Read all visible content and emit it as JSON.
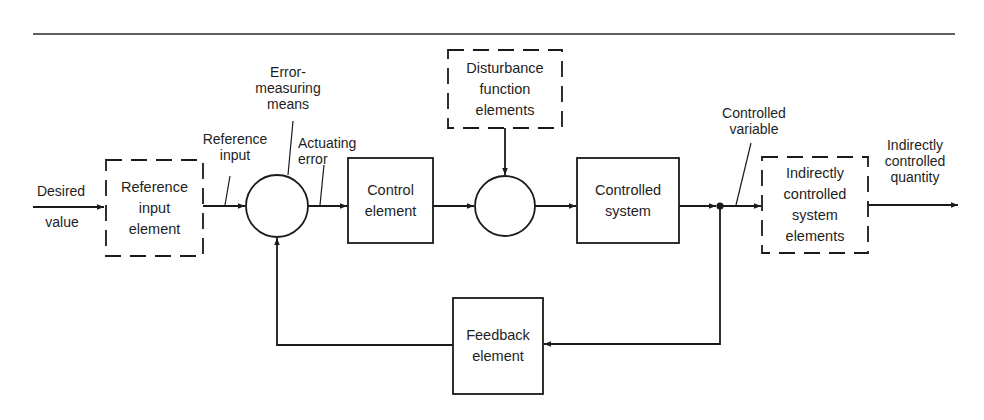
{
  "diagram": {
    "type": "feedback control system block diagram",
    "blocks": {
      "reference_input_element": {
        "label": "Reference\ninput\nelement",
        "style": "dashed"
      },
      "error_measuring_means": {
        "label": "",
        "shape": "circle"
      },
      "control_element": {
        "label": "Control\nelement",
        "style": "solid"
      },
      "disturbance_summing_point": {
        "label": "",
        "shape": "circle"
      },
      "disturbance_function_elements": {
        "label": "Disturbance\nfunction\nelements",
        "style": "dashed"
      },
      "controlled_system": {
        "label": "Controlled\nsystem",
        "style": "solid"
      },
      "indirectly_controlled_system_elements": {
        "label": "Indirectly\ncontrolled\nsystem\nelements",
        "style": "dashed"
      },
      "feedback_element": {
        "label": "Feedback\nelement",
        "style": "solid"
      }
    },
    "signal_labels": {
      "desired": "Desired",
      "value": "value",
      "reference_input": "Reference\ninput",
      "error_measuring_means": "Error-\nmeasuring\nmeans",
      "actuating_error": "Actuating\nerror",
      "controlled_variable": "Controlled\nvariable",
      "indirectly_controlled_quantity": "Indirectly\ncontrolled\nquantity"
    },
    "colors": {
      "line": "#1a1a1a",
      "background": "#ffffff"
    }
  }
}
